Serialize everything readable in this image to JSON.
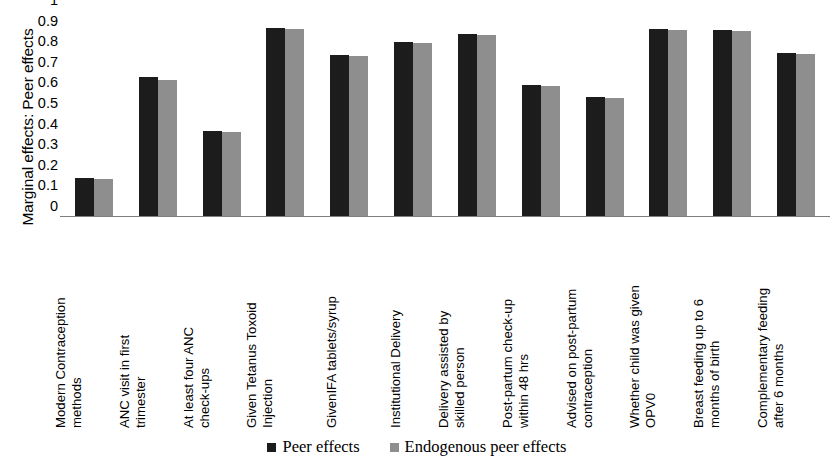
{
  "chart_data": {
    "type": "bar",
    "title": "",
    "xlabel": "",
    "ylabel": "Marginal effects: Peer effects",
    "ylim": [
      0,
      1
    ],
    "ytick_labels": [
      "1",
      "0.9",
      "0.8",
      "0.7",
      "0.6",
      "0.5",
      "0.4",
      "0.3",
      "0.2",
      "0.1",
      "0"
    ],
    "ytick_values": [
      1,
      0.9,
      0.8,
      0.7,
      0.6,
      0.5,
      0.4,
      0.3,
      0.2,
      0.1,
      0
    ],
    "grid": false,
    "legend_position": "bottom-center",
    "categories": [
      "Modern Contraception methods",
      "ANC visit in first trimester",
      "At least four ANC check-ups",
      "Given Tetanus Toxoid Injection",
      "GivenIFA tablets/syrup",
      "Institutional Delivery",
      "Delivery assisted by skilled person",
      "Post-partum check-up within 48 hrs",
      "Advised on post-partum contraception",
      "Whether child was given OPV0",
      "Breast feeding up to 6 months of birth",
      "Complementary feeding after 6 months"
    ],
    "category_lines": [
      [
        "Modern Contraception",
        "methods"
      ],
      [
        "ANC visit in first",
        "trimester"
      ],
      [
        "At least four ANC",
        "check-ups"
      ],
      [
        "Given Tetanus Toxoid",
        "Injection"
      ],
      [
        "GivenIFA tablets/syrup"
      ],
      [
        "Institutional Delivery"
      ],
      [
        "Delivery assisted by",
        "skilled person"
      ],
      [
        "Post-partum check-up",
        "within 48 hrs"
      ],
      [
        "Advised on post-partum",
        "contraception"
      ],
      [
        "Whether child was given",
        "OPV0"
      ],
      [
        "Breast feeding up to 6",
        "months of birth"
      ],
      [
        "Complementary feeding",
        "after 6 months"
      ]
    ],
    "series": [
      {
        "name": "Peer effects",
        "color": "#1c1c1c",
        "values": [
          0.185,
          0.675,
          0.415,
          0.915,
          0.78,
          0.845,
          0.885,
          0.635,
          0.58,
          0.91,
          0.905,
          0.79
        ]
      },
      {
        "name": "Endogenous peer effects",
        "color": "#8e8e8e",
        "values": [
          0.18,
          0.66,
          0.41,
          0.91,
          0.775,
          0.84,
          0.88,
          0.63,
          0.575,
          0.905,
          0.9,
          0.785
        ]
      }
    ]
  },
  "legend": {
    "items": [
      {
        "label": "Peer effects",
        "color": "#1c1c1c"
      },
      {
        "label": "Endogenous peer effects",
        "color": "#8e8e8e"
      }
    ]
  }
}
